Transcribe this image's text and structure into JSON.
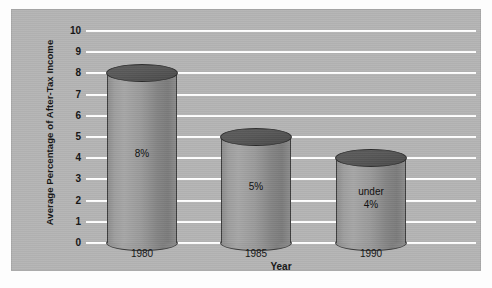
{
  "chart_data": {
    "type": "bar",
    "title": "",
    "xlabel": "Year",
    "ylabel": "Average Percentage of After-Tax Income",
    "categories": [
      "1980",
      "1985",
      "1990"
    ],
    "values": [
      8,
      5,
      4
    ],
    "data_labels": [
      "8%",
      "5%",
      "under\n4%"
    ],
    "ylim": [
      0,
      10
    ],
    "ytick_labels": [
      "10",
      "9",
      "8",
      "7",
      "6",
      "5",
      "4",
      "3",
      "2",
      "1",
      "0"
    ],
    "ytick_values": [
      10,
      9,
      8,
      7,
      6,
      5,
      4,
      3,
      2,
      1,
      0
    ],
    "grid": true,
    "grid_color": "#ffffff",
    "legend": null,
    "plot_background": "#b4b4b4",
    "bar_style": "cylinder",
    "bar_color": "#9a9a9a",
    "bar_top_color": "#505050"
  },
  "bars": [
    {
      "category": "1980",
      "value": 8,
      "label": "8%",
      "label_line2": ""
    },
    {
      "category": "1985",
      "value": 5,
      "label": "5%",
      "label_line2": ""
    },
    {
      "category": "1990",
      "value": 4,
      "label": "under",
      "label_line2": "4%"
    }
  ],
  "axes": {
    "y_title": "Average Percentage of After-Tax Income",
    "x_title": "Year"
  }
}
